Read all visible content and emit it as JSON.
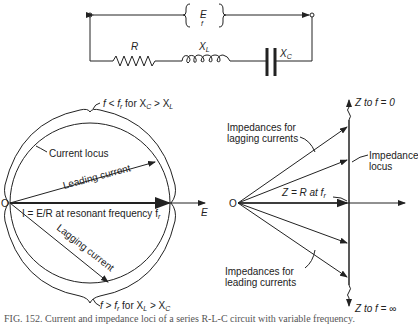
{
  "circuit": {
    "source_label": "E",
    "frequency_label": "f",
    "resistor_label": "R",
    "inductor_label": "X",
    "inductor_sub": "L",
    "capacitor_label": "X",
    "capacitor_sub": "C"
  },
  "current_diagram": {
    "origin_label": "O",
    "axis_label": "E",
    "top_note": "f < f",
    "top_note_sub": "r",
    "top_note_cond": " for X",
    "top_note_cond_sub1": "C",
    "top_note_cond_mid": " > X",
    "top_note_cond_sub2": "L",
    "current_locus_label": "Current locus",
    "leading_current_label": "Leading current",
    "resonant_label": "I = E/R at resonant frequency f",
    "resonant_label_sub": "r",
    "lagging_current_label": "Lagging current",
    "bottom_note": "f > f",
    "bottom_note_sub": "r",
    "bottom_note_cond": " for X",
    "bottom_note_cond_sub1": "L",
    "bottom_note_cond_mid": " > X",
    "bottom_note_cond_sub2": "C"
  },
  "impedance_diagram": {
    "origin_label": "O",
    "top_label": "Z to f = 0",
    "bottom_label": "Z to f = ∞",
    "lagging_label_line1": "Impedances for",
    "lagging_label_line2": "lagging currents",
    "locus_label_line1": "Impedance",
    "locus_label_line2": "locus",
    "resonant_label": "Z = R at f",
    "resonant_label_sub": "r",
    "leading_label_line1": "Impedances for",
    "leading_label_line2": "leading currents"
  },
  "caption": "FIG. 152. Current and impedance loci of a series R-L-C circuit with variable frequency."
}
